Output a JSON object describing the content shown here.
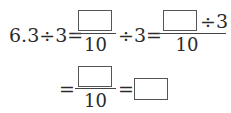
{
  "problem": {
    "row1": {
      "lhs": "6.3÷3=",
      "frac1_denominator": "10",
      "op_after_frac1": "÷3=",
      "frac2_numerator_suffix": "÷3",
      "frac2_denominator": "10"
    },
    "row2": {
      "equals_lead": "=",
      "frac3_denominator": "10",
      "equals_mid": "="
    },
    "blanks": 4
  }
}
